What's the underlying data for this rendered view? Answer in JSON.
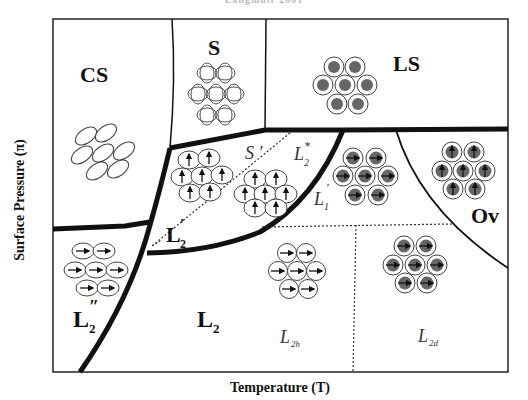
{
  "header": {
    "caption": "Langmuir 2001"
  },
  "axes": {
    "x_label": "Temperature (T)",
    "y_label": "Surface Pressure (π)"
  },
  "phases": {
    "cs": "CS",
    "s": "S",
    "ls": "LS",
    "ov": "Ov",
    "l2": "L",
    "l2_sub": "2",
    "l2p": "L",
    "l2p_sub": "2",
    "l2p_mark": "′",
    "l2pp": "L",
    "l2pp_sub": "2",
    "l2pp_mark": "″",
    "s_prime": "S ′",
    "l2_star": "L",
    "l2_star_sub": "2",
    "l2_star_sup": "*",
    "l1p": "L",
    "l1p_sub": "1",
    "l1p_mark": "′",
    "l2h": "L",
    "l2h_sub": "2h",
    "l2d": "L",
    "l2d_sub": "2d"
  },
  "colors": {
    "line": "#111111",
    "fill_dark": "#666666",
    "molecule_stroke": "#444444"
  }
}
